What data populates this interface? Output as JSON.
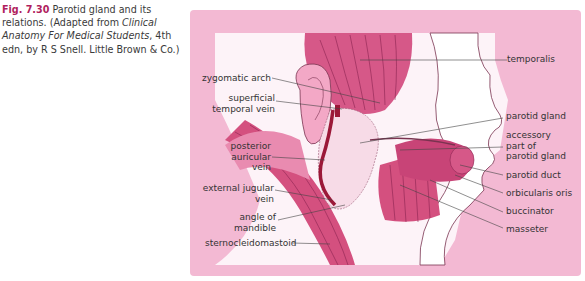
{
  "caption": {
    "figure_number": "Fig. 7.30",
    "title": "Parotid gland and its relations.",
    "adapted_prefix": "(Adapted from ",
    "source_title": "Clinical Anatomy For Medical Students",
    "adapted_suffix": ", 4th edn, by R S Snell. Little Brown & Co.)"
  },
  "colors": {
    "panel_background": "#f3b9d3",
    "muscle": "#d4507f",
    "muscle_light": "#e98bb0",
    "vein": "#9b1838",
    "gland": "#f7dbe7",
    "skin": "#fdf1f6"
  },
  "labels_left": [
    {
      "id": "zygomatic-arch",
      "lines": [
        "zygomatic arch"
      ]
    },
    {
      "id": "superficial-temporal-vein",
      "lines": [
        "superficial",
        "temporal vein"
      ]
    },
    {
      "id": "posterior-auricular-vein",
      "lines": [
        "posterior",
        "auricular",
        "vein"
      ]
    },
    {
      "id": "external-jugular-vein",
      "lines": [
        "external jugular",
        "vein"
      ]
    },
    {
      "id": "angle-of-mandible",
      "lines": [
        "angle of",
        "mandible"
      ]
    },
    {
      "id": "sternocleidomastoid",
      "lines": [
        "sternocleidomastoid"
      ]
    }
  ],
  "labels_right": [
    {
      "id": "temporalis",
      "lines": [
        "temporalis"
      ]
    },
    {
      "id": "parotid-gland",
      "lines": [
        "parotid gland"
      ]
    },
    {
      "id": "accessory-part-of-parotid-gland",
      "lines": [
        "accessory",
        "part of",
        "parotid gland"
      ]
    },
    {
      "id": "parotid-duct",
      "lines": [
        "parotid duct"
      ]
    },
    {
      "id": "orbicularis-oris",
      "lines": [
        "orbicularis oris"
      ]
    },
    {
      "id": "buccinator",
      "lines": [
        "buccinator"
      ]
    },
    {
      "id": "masseter",
      "lines": [
        "masseter"
      ]
    }
  ]
}
